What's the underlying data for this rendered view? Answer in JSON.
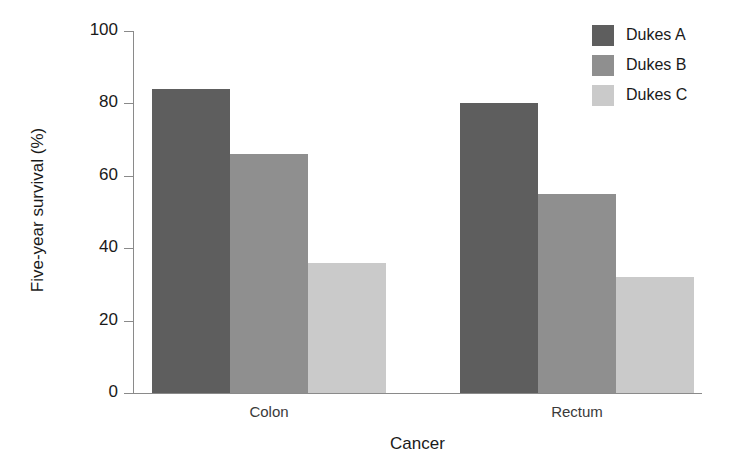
{
  "chart_data": {
    "type": "bar",
    "title": "",
    "xlabel": "Cancer",
    "ylabel": "Five-year survival (%)",
    "categories": [
      "Colon",
      "Rectum"
    ],
    "series": [
      {
        "name": "Dukes A",
        "values": [
          84,
          80
        ],
        "color": "#5e5e5e"
      },
      {
        "name": "Dukes B",
        "values": [
          66,
          55
        ],
        "color": "#8f8f8f"
      },
      {
        "name": "Dukes C",
        "values": [
          36,
          32
        ],
        "color": "#cacaca"
      }
    ],
    "ylim": [
      0,
      100
    ],
    "yticks": [
      0,
      20,
      40,
      60,
      80,
      100
    ],
    "ytick_labels": [
      "0",
      "20",
      "40",
      "60",
      "80",
      "100"
    ],
    "grid": false,
    "legend_position": "top-right",
    "grouping": "grouped",
    "bar_gap_within_group": 0
  },
  "axes": {
    "y_title": "Five-year survival (%)",
    "x_title": "Cancer"
  },
  "legend": {
    "entries": [
      {
        "label": "Dukes A",
        "color": "#5e5e5e"
      },
      {
        "label": "Dukes B",
        "color": "#8f8f8f"
      },
      {
        "label": "Dukes C",
        "color": "#cacaca"
      }
    ]
  },
  "colors": {
    "axis": "#8a8a8a",
    "text": "#1a1a1a",
    "background": "#ffffff"
  }
}
